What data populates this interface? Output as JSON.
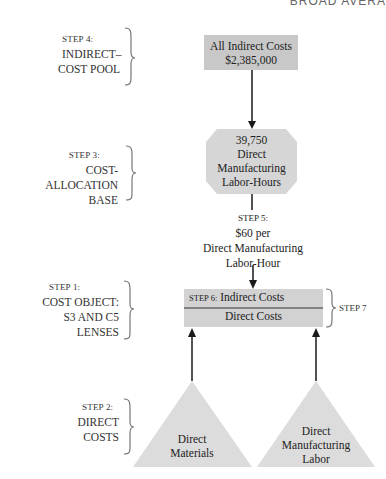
{
  "header": {
    "running_title": "BROAD AVERA"
  },
  "colors": {
    "box_fill": "#c8c8c8",
    "octagon_fill": "#d6d6d6",
    "triangle_fill": "#dcdcdc",
    "line": "#1a1a1a",
    "bracket": "#777777"
  },
  "steps": {
    "step4": {
      "label": "STEP 4:",
      "line1": "INDIRECT–",
      "line2": "COST POOL"
    },
    "step3": {
      "label": "STEP 3:",
      "line1": "COST-ALLOCATION",
      "line2": "BASE"
    },
    "step1": {
      "label": "STEP 1:",
      "line1": "COST OBJECT:",
      "line2": "S3 AND C5",
      "line3": "LENSES"
    },
    "step2": {
      "label": "STEP 2:",
      "line1": "DIRECT",
      "line2": "COSTS"
    },
    "step5": {
      "label": "STEP 5:",
      "line1": "$60 per",
      "line2": "Direct Manufacturing",
      "line3": "Labor-Hour"
    },
    "step6": {
      "label": "STEP 6:",
      "text": "Indirect Costs"
    },
    "step7": {
      "label": "STEP 7"
    }
  },
  "nodes": {
    "cost_pool": {
      "line1": "All Indirect Costs",
      "line2": "$2,385,000"
    },
    "allocation_base": {
      "line1": "39,750",
      "line2": "Direct",
      "line3": "Manufacturing",
      "line4": "Labor-Hours"
    },
    "cost_object": {
      "direct_costs": "Direct Costs"
    },
    "direct_materials": {
      "line1": "Direct",
      "line2": "Materials"
    },
    "direct_labor": {
      "line1": "Direct",
      "line2": "Manufacturing",
      "line3": "Labor"
    }
  }
}
